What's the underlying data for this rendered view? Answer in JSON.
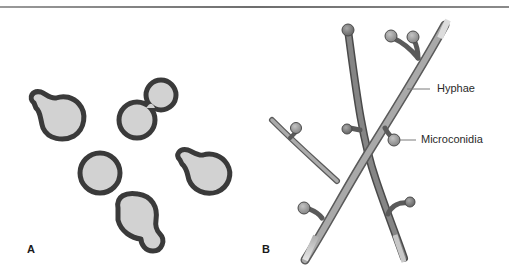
{
  "figure": {
    "panels": [
      {
        "id": "A",
        "label": "A",
        "subject": "budding yeast cells"
      },
      {
        "id": "B",
        "label": "B",
        "subject": "hyphae with microconidia"
      }
    ],
    "callouts": {
      "hyphae": "Hyphae",
      "microconidia": "Microconidia"
    },
    "colors": {
      "cell_wall": "#3a3a3a",
      "cell_fill": "#d2d2d2",
      "hypha_dark": "#7a7a7a",
      "hypha_light": "#a9a9a9",
      "outline": "#4a4a4a"
    }
  }
}
